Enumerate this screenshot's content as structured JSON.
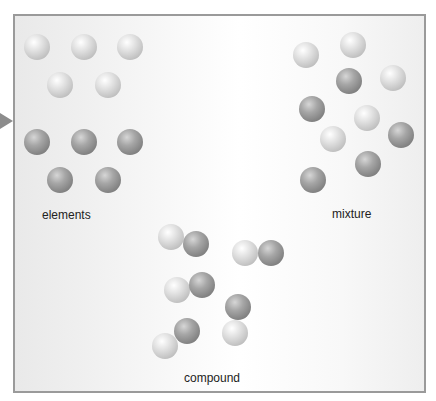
{
  "diagram": {
    "groups": [
      {
        "label": "elements",
        "label_pos": [
          42,
          208
        ],
        "balls": [
          {
            "x": 24,
            "y": 34,
            "type": "light"
          },
          {
            "x": 71,
            "y": 34,
            "type": "light"
          },
          {
            "x": 117,
            "y": 34,
            "type": "light"
          },
          {
            "x": 47,
            "y": 72,
            "type": "light"
          },
          {
            "x": 95,
            "y": 72,
            "type": "light"
          },
          {
            "x": 24,
            "y": 129,
            "type": "dark"
          },
          {
            "x": 71,
            "y": 129,
            "type": "dark"
          },
          {
            "x": 117,
            "y": 129,
            "type": "dark"
          },
          {
            "x": 47,
            "y": 167,
            "type": "dark"
          },
          {
            "x": 95,
            "y": 167,
            "type": "dark"
          }
        ]
      },
      {
        "label": "mixture",
        "label_pos": [
          332,
          207
        ],
        "balls": [
          {
            "x": 293,
            "y": 42,
            "type": "light"
          },
          {
            "x": 340,
            "y": 32,
            "type": "light"
          },
          {
            "x": 336,
            "y": 68,
            "type": "dark"
          },
          {
            "x": 380,
            "y": 65,
            "type": "light"
          },
          {
            "x": 299,
            "y": 96,
            "type": "dark"
          },
          {
            "x": 354,
            "y": 105,
            "type": "light"
          },
          {
            "x": 320,
            "y": 126,
            "type": "light"
          },
          {
            "x": 388,
            "y": 122,
            "type": "dark"
          },
          {
            "x": 355,
            "y": 151,
            "type": "dark"
          },
          {
            "x": 300,
            "y": 167,
            "type": "dark"
          }
        ]
      },
      {
        "label": "compound",
        "label_pos": [
          184,
          371
        ],
        "balls": [
          {
            "x": 158,
            "y": 224,
            "type": "light"
          },
          {
            "x": 183,
            "y": 231,
            "type": "dark"
          },
          {
            "x": 232,
            "y": 240,
            "type": "light"
          },
          {
            "x": 258,
            "y": 240,
            "type": "dark"
          },
          {
            "x": 164,
            "y": 277,
            "type": "light"
          },
          {
            "x": 189,
            "y": 272,
            "type": "dark"
          },
          {
            "x": 225,
            "y": 294,
            "type": "dark"
          },
          {
            "x": 222,
            "y": 320,
            "type": "light"
          },
          {
            "x": 174,
            "y": 318,
            "type": "dark"
          },
          {
            "x": 152,
            "y": 333,
            "type": "light"
          }
        ]
      }
    ]
  }
}
